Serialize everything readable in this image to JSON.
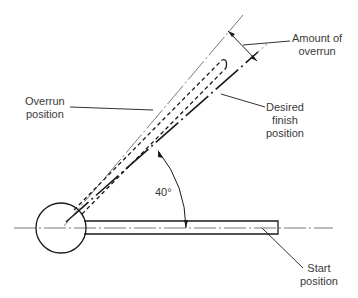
{
  "diagram": {
    "labels": {
      "amount_of_overrun": [
        "Amount of",
        "overrun"
      ],
      "overrun_position": [
        "Overrun",
        "position"
      ],
      "desired_finish_position": [
        "Desired",
        "finish",
        "position"
      ],
      "start_position": [
        "Start",
        "position"
      ],
      "angle": "40°"
    },
    "colors": {
      "line": "#1a1a1a",
      "thin_line": "#555555",
      "text": "#3a3a3a",
      "background": "#ffffff"
    }
  }
}
